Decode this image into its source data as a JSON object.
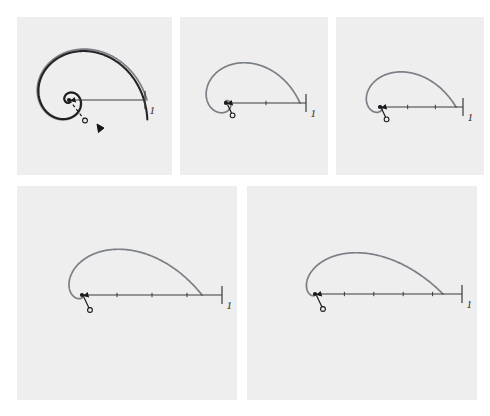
{
  "figure": {
    "caption": "",
    "background_color": "#ffffff",
    "panel_background_color": "#eeeeee",
    "spiral_color": "#7b7f86",
    "accent_spiral_color": "#141414",
    "axis_color": "#3a3a3a",
    "marker_color": "#1a1a1a"
  },
  "chart_data": {
    "type": "line",
    "title": "",
    "xlabel": "",
    "ylabel": "",
    "grid": false,
    "legend": "none",
    "panels": [
      {
        "index": 1,
        "label": "1",
        "tick_label": "1",
        "tick_count": 1,
        "growth_rate_b": 0.3,
        "turns": 2.0,
        "unit_radius_px": 78,
        "has_accent_overlay": true,
        "accent_overlay_rotation_deg": 14,
        "accent_arrowhead": true,
        "radius_arrow_dashed": true,
        "centre_dot": true,
        "open_circle_marker": true
      },
      {
        "index": 2,
        "label": "1",
        "tick_label": "1",
        "tick_count": 2,
        "growth_rate_b": 0.45,
        "turns": 1.62,
        "unit_radius_px": 74,
        "has_accent_overlay": false,
        "accent_overlay_rotation_deg": 0,
        "accent_arrowhead": false,
        "radius_arrow_dashed": false,
        "centre_dot": true,
        "open_circle_marker": true
      },
      {
        "index": 3,
        "label": "1",
        "tick_label": "1",
        "tick_count": 3,
        "growth_rate_b": 0.6,
        "turns": 1.46,
        "unit_radius_px": 76,
        "has_accent_overlay": false,
        "accent_overlay_rotation_deg": 0,
        "accent_arrowhead": false,
        "radius_arrow_dashed": false,
        "centre_dot": true,
        "open_circle_marker": true
      },
      {
        "index": 4,
        "label": "1",
        "tick_label": "1",
        "tick_count": 4,
        "growth_rate_b": 0.8,
        "turns": 1.36,
        "unit_radius_px": 120,
        "has_accent_overlay": false,
        "accent_overlay_rotation_deg": 0,
        "accent_arrowhead": false,
        "radius_arrow_dashed": false,
        "centre_dot": true,
        "open_circle_marker": true
      },
      {
        "index": 5,
        "label": "1",
        "tick_label": "1",
        "tick_count": 5,
        "growth_rate_b": 1.0,
        "turns": 1.3,
        "unit_radius_px": 128,
        "has_accent_overlay": false,
        "accent_overlay_rotation_deg": 0,
        "accent_arrowhead": false,
        "radius_arrow_dashed": false,
        "centre_dot": true,
        "open_circle_marker": true
      }
    ]
  },
  "panel_geometry": [
    {
      "x": 17,
      "y": 17,
      "w": 155,
      "h": 158,
      "cx": 69,
      "cy": 100,
      "axis_x2": 145
    },
    {
      "x": 180,
      "y": 17,
      "w": 148,
      "h": 158,
      "cx": 226,
      "cy": 103,
      "axis_x2": 306
    },
    {
      "x": 336,
      "y": 17,
      "w": 148,
      "h": 158,
      "cx": 380,
      "cy": 107,
      "axis_x2": 463
    },
    {
      "x": 17,
      "y": 186,
      "w": 220,
      "h": 214,
      "cx": 82,
      "cy": 295,
      "axis_x2": 222
    },
    {
      "x": 247,
      "y": 186,
      "w": 230,
      "h": 214,
      "cx": 315,
      "cy": 294,
      "axis_x2": 462
    }
  ]
}
